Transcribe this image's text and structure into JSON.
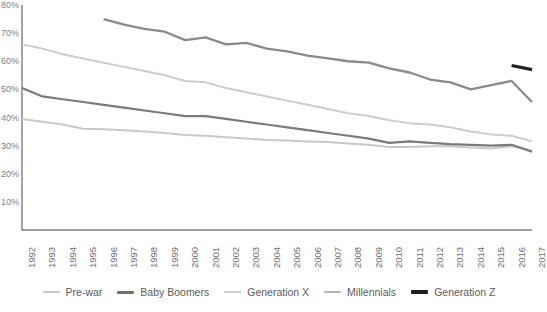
{
  "chart_data": {
    "type": "line",
    "title": "",
    "subtitle": "",
    "xlabel": "",
    "ylabel": "",
    "grid": false,
    "legend_position": "bottom",
    "x": [
      1992,
      1993,
      1994,
      1995,
      1996,
      1997,
      1998,
      1999,
      2000,
      2001,
      2002,
      2003,
      2004,
      2005,
      2006,
      2007,
      2008,
      2009,
      2010,
      2011,
      2012,
      2013,
      2014,
      2015,
      2016,
      2017
    ],
    "categories": [
      "1992",
      "1993",
      "1994",
      "1995",
      "1996",
      "1997",
      "1998",
      "1999",
      "2000",
      "2001",
      "2002",
      "2003",
      "2004",
      "2005",
      "2006",
      "2007",
      "2008",
      "2009",
      "2010",
      "2011",
      "2012",
      "2013",
      "2014",
      "2015",
      "2016",
      "2017"
    ],
    "xlim": [
      1992,
      2017
    ],
    "ylim": [
      0,
      80
    ],
    "y_ticks": [
      "80%",
      "70%",
      "60%",
      "50%",
      "40%",
      "30%",
      "20%",
      "10%"
    ],
    "y_tick_values": [
      80,
      70,
      60,
      50,
      40,
      30,
      20,
      10
    ],
    "series": [
      {
        "name": "Pre-war",
        "color": "#c8c8c8",
        "width": 2.0,
        "x": [
          1992,
          1993,
          1994,
          1995,
          1996,
          1997,
          1998,
          1999,
          2000,
          2001,
          2002,
          2003,
          2004,
          2005,
          2006,
          2007,
          2008,
          2009,
          2010,
          2011,
          2012,
          2013,
          2014,
          2015,
          2016,
          2017
        ],
        "values": [
          39.5,
          38.5,
          37.5,
          36.0,
          35.8,
          35.5,
          35.0,
          34.5,
          33.8,
          33.5,
          33.0,
          32.5,
          32.0,
          31.8,
          31.5,
          31.3,
          30.8,
          30.3,
          29.5,
          29.5,
          29.8,
          29.8,
          29.3,
          29.0,
          29.8,
          28.3
        ]
      },
      {
        "name": "Baby Boomers",
        "color": "#7a7a7a",
        "width": 2.2,
        "x": [
          1992,
          1993,
          1994,
          1995,
          1996,
          1997,
          1998,
          1999,
          2000,
          2001,
          2002,
          2003,
          2004,
          2005,
          2006,
          2007,
          2008,
          2009,
          2010,
          2011,
          2012,
          2013,
          2014,
          2015,
          2016,
          2017
        ],
        "values": [
          50.5,
          47.5,
          46.5,
          45.5,
          44.5,
          43.5,
          42.5,
          41.5,
          40.5,
          40.5,
          39.5,
          38.5,
          37.5,
          36.5,
          35.5,
          34.5,
          33.5,
          32.5,
          31.0,
          31.5,
          31.0,
          30.5,
          30.3,
          30.0,
          30.3,
          27.8
        ]
      },
      {
        "name": "Generation X",
        "color": "#cdcdcd",
        "width": 2.0,
        "x": [
          1992,
          1993,
          1994,
          1995,
          1996,
          1997,
          1998,
          1999,
          2000,
          2001,
          2002,
          2003,
          2004,
          2005,
          2006,
          2007,
          2008,
          2009,
          2010,
          2011,
          2012,
          2013,
          2014,
          2015,
          2016,
          2017
        ],
        "values": [
          66.0,
          64.5,
          62.5,
          61.0,
          59.5,
          58.0,
          56.5,
          55.0,
          53.0,
          52.5,
          50.5,
          49.0,
          47.5,
          46.0,
          44.5,
          43.0,
          41.5,
          40.5,
          39.0,
          38.0,
          37.5,
          36.5,
          35.0,
          34.0,
          33.5,
          31.5
        ]
      },
      {
        "name": "Millennials",
        "color": "#8a8a8a",
        "width": 2.3,
        "x": [
          1996,
          1997,
          1998,
          1999,
          2000,
          2001,
          2002,
          2003,
          2004,
          2005,
          2006,
          2007,
          2008,
          2009,
          2010,
          2011,
          2012,
          2013,
          2014,
          2015,
          2016,
          2017
        ],
        "values": [
          75.0,
          73.0,
          71.5,
          70.5,
          67.5,
          68.5,
          66.0,
          66.5,
          64.5,
          63.5,
          62.0,
          61.0,
          60.0,
          59.5,
          57.5,
          56.0,
          53.5,
          52.5,
          50.0,
          51.5,
          53.0,
          45.5
        ]
      },
      {
        "name": "Generation Z",
        "color": "#1f1f1f",
        "width": 3.2,
        "x": [
          2016,
          2017
        ],
        "values": [
          58.5,
          57.0
        ]
      }
    ]
  },
  "legend": {
    "items": [
      {
        "label": "Pre-war",
        "color": "#c8c8c8",
        "width": 2.2
      },
      {
        "label": "Baby Boomers",
        "color": "#6f6f6f",
        "width": 3.0
      },
      {
        "label": "Generation X",
        "color": "#cdcdcd",
        "width": 2.2
      },
      {
        "label": "Millennials",
        "color": "#b4b4b4",
        "width": 2.2
      },
      {
        "label": "Generation Z",
        "color": "#1f1f1f",
        "width": 3.2
      }
    ]
  },
  "axes": {
    "axis_color": "#7f7f7f",
    "tick_color": "#808080",
    "label_color": "#6e6e6e"
  }
}
